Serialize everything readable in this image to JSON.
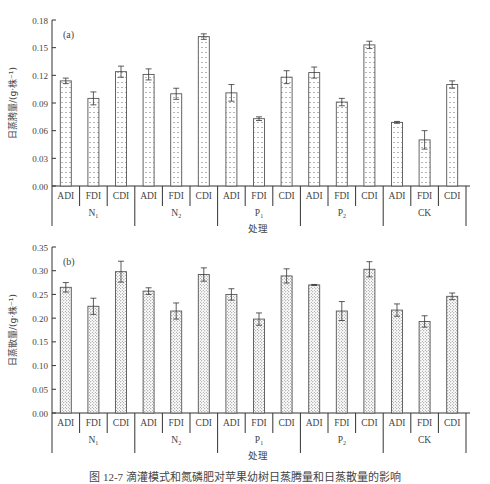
{
  "chart_data": [
    {
      "type": "bar",
      "panel_label": "(a)",
      "ylabel": "日蒸腾量/(g·株⁻¹)",
      "xlabel": "处理",
      "ylim": [
        0,
        0.18
      ],
      "yticks": [
        "0.00",
        "0.03",
        "0.06",
        "0.09",
        "0.12",
        "0.15",
        "0.18"
      ],
      "groups": [
        "N1",
        "N2",
        "P1",
        "P2",
        "CK"
      ],
      "categories": [
        "ADI",
        "FDI",
        "CDI",
        "ADI",
        "FDI",
        "CDI",
        "ADI",
        "FDI",
        "CDI",
        "ADI",
        "FDI",
        "CDI",
        "ADI",
        "FDI",
        "CDI"
      ],
      "values": [
        0.114,
        0.095,
        0.124,
        0.121,
        0.1,
        0.162,
        0.101,
        0.073,
        0.118,
        0.123,
        0.091,
        0.153,
        0.069,
        0.05,
        0.11
      ],
      "errors": [
        0.003,
        0.007,
        0.006,
        0.006,
        0.006,
        0.003,
        0.009,
        0.002,
        0.007,
        0.006,
        0.004,
        0.004,
        0.001,
        0.01,
        0.004
      ],
      "grid": false,
      "legend": null
    },
    {
      "type": "bar",
      "panel_label": "(b)",
      "ylabel": "日蒸散量/(g·株⁻¹)",
      "xlabel": "处理",
      "ylim": [
        0,
        0.35
      ],
      "yticks": [
        "0.00",
        "0.05",
        "0.10",
        "0.15",
        "0.20",
        "0.25",
        "0.30",
        "0.35"
      ],
      "groups": [
        "N1",
        "N2",
        "P1",
        "P2",
        "CK"
      ],
      "categories": [
        "ADI",
        "FDI",
        "CDI",
        "ADI",
        "FDI",
        "CDI",
        "ADI",
        "FDI",
        "CDI",
        "ADI",
        "FDI",
        "CDI",
        "ADI",
        "FDI",
        "CDI"
      ],
      "values": [
        0.265,
        0.225,
        0.298,
        0.257,
        0.215,
        0.292,
        0.25,
        0.198,
        0.289,
        0.27,
        0.215,
        0.303,
        0.217,
        0.193,
        0.246
      ],
      "errors": [
        0.01,
        0.017,
        0.022,
        0.007,
        0.017,
        0.014,
        0.012,
        0.013,
        0.015,
        0.001,
        0.02,
        0.016,
        0.013,
        0.012,
        0.007
      ],
      "grid": false,
      "legend": null
    }
  ],
  "caption": "图 12-7  滴灌模式和氮磷肥对苹果幼树日蒸腾量和日蒸散量的影响"
}
